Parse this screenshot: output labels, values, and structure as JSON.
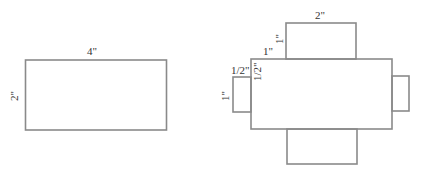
{
  "diagram": {
    "left_figure": {
      "description": "rectangle",
      "width_label": "4\"",
      "height_label": "2\""
    },
    "right_figure": {
      "description": "net of rectangular prism",
      "top_tab_width_label": "2\"",
      "top_tab_height_label": "1\"",
      "main_top_offset_label": "1\"",
      "left_tab_width_label": "1/2\"",
      "left_tab_offset_label": "1/2\"",
      "left_tab_height_label": "1\""
    },
    "stroke_color": "#8a8a8a"
  }
}
